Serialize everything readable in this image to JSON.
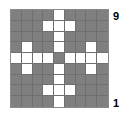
{
  "figure": {
    "type": "grid-pattern",
    "width": 130,
    "height": 121,
    "background_color": "#ffffff"
  },
  "grid": {
    "rows": 9,
    "cols": 9,
    "on_color": "#ffffff",
    "off_color": "#808080",
    "gridline_color": "#6f6f6f",
    "border_color": "#8a8a8a",
    "cells": [
      [
        0,
        0,
        0,
        0,
        1,
        0,
        0,
        0,
        0
      ],
      [
        0,
        0,
        0,
        1,
        1,
        1,
        0,
        0,
        0
      ],
      [
        0,
        0,
        0,
        0,
        1,
        0,
        0,
        0,
        0
      ],
      [
        0,
        1,
        0,
        0,
        1,
        0,
        0,
        1,
        0
      ],
      [
        1,
        1,
        1,
        1,
        0,
        1,
        1,
        1,
        1
      ],
      [
        0,
        1,
        0,
        0,
        1,
        0,
        0,
        1,
        0
      ],
      [
        0,
        0,
        0,
        0,
        1,
        0,
        0,
        0,
        0
      ],
      [
        0,
        0,
        0,
        1,
        1,
        1,
        0,
        0,
        0
      ],
      [
        0,
        0,
        0,
        0,
        1,
        0,
        0,
        0,
        0
      ]
    ]
  },
  "labels": {
    "top": "9",
    "bottom": "1"
  },
  "chart_data": {
    "type": "heatmap",
    "title": "",
    "xlabel": "",
    "ylabel": "",
    "x": [
      1,
      2,
      3,
      4,
      5,
      6,
      7,
      8,
      9
    ],
    "y": [
      9,
      8,
      7,
      6,
      5,
      4,
      3,
      2,
      1
    ],
    "tick_labels_y_visible": [
      "9",
      "1"
    ],
    "grid": true,
    "legend": "none",
    "values": [
      [
        0,
        0,
        0,
        0,
        1,
        0,
        0,
        0,
        0
      ],
      [
        0,
        0,
        0,
        1,
        1,
        1,
        0,
        0,
        0
      ],
      [
        0,
        0,
        0,
        0,
        1,
        0,
        0,
        0,
        0
      ],
      [
        0,
        1,
        0,
        0,
        1,
        0,
        0,
        1,
        0
      ],
      [
        1,
        1,
        1,
        1,
        0,
        1,
        1,
        1,
        1
      ],
      [
        0,
        1,
        0,
        0,
        1,
        0,
        0,
        1,
        0
      ],
      [
        0,
        0,
        0,
        0,
        1,
        0,
        0,
        0,
        0
      ],
      [
        0,
        0,
        0,
        1,
        1,
        1,
        0,
        0,
        0
      ],
      [
        0,
        0,
        0,
        0,
        1,
        0,
        0,
        0,
        0
      ]
    ],
    "colormap": {
      "0": "#808080",
      "1": "#ffffff"
    },
    "zlim": [
      0,
      1
    ]
  }
}
